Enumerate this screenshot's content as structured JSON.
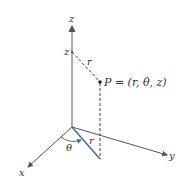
{
  "diagram": {
    "labels": {
      "z_axis": "z",
      "z_height": "z",
      "r_top": "r",
      "point": "P = (r, θ, z)",
      "r_bottom": "r",
      "theta": "θ",
      "x_axis": "x",
      "y_axis": "y"
    },
    "colors": {
      "axis": "#666666",
      "radial": "#3a5fa8",
      "arc": "#3a7d6a",
      "dashed": "#444444",
      "text": "#333333"
    }
  }
}
